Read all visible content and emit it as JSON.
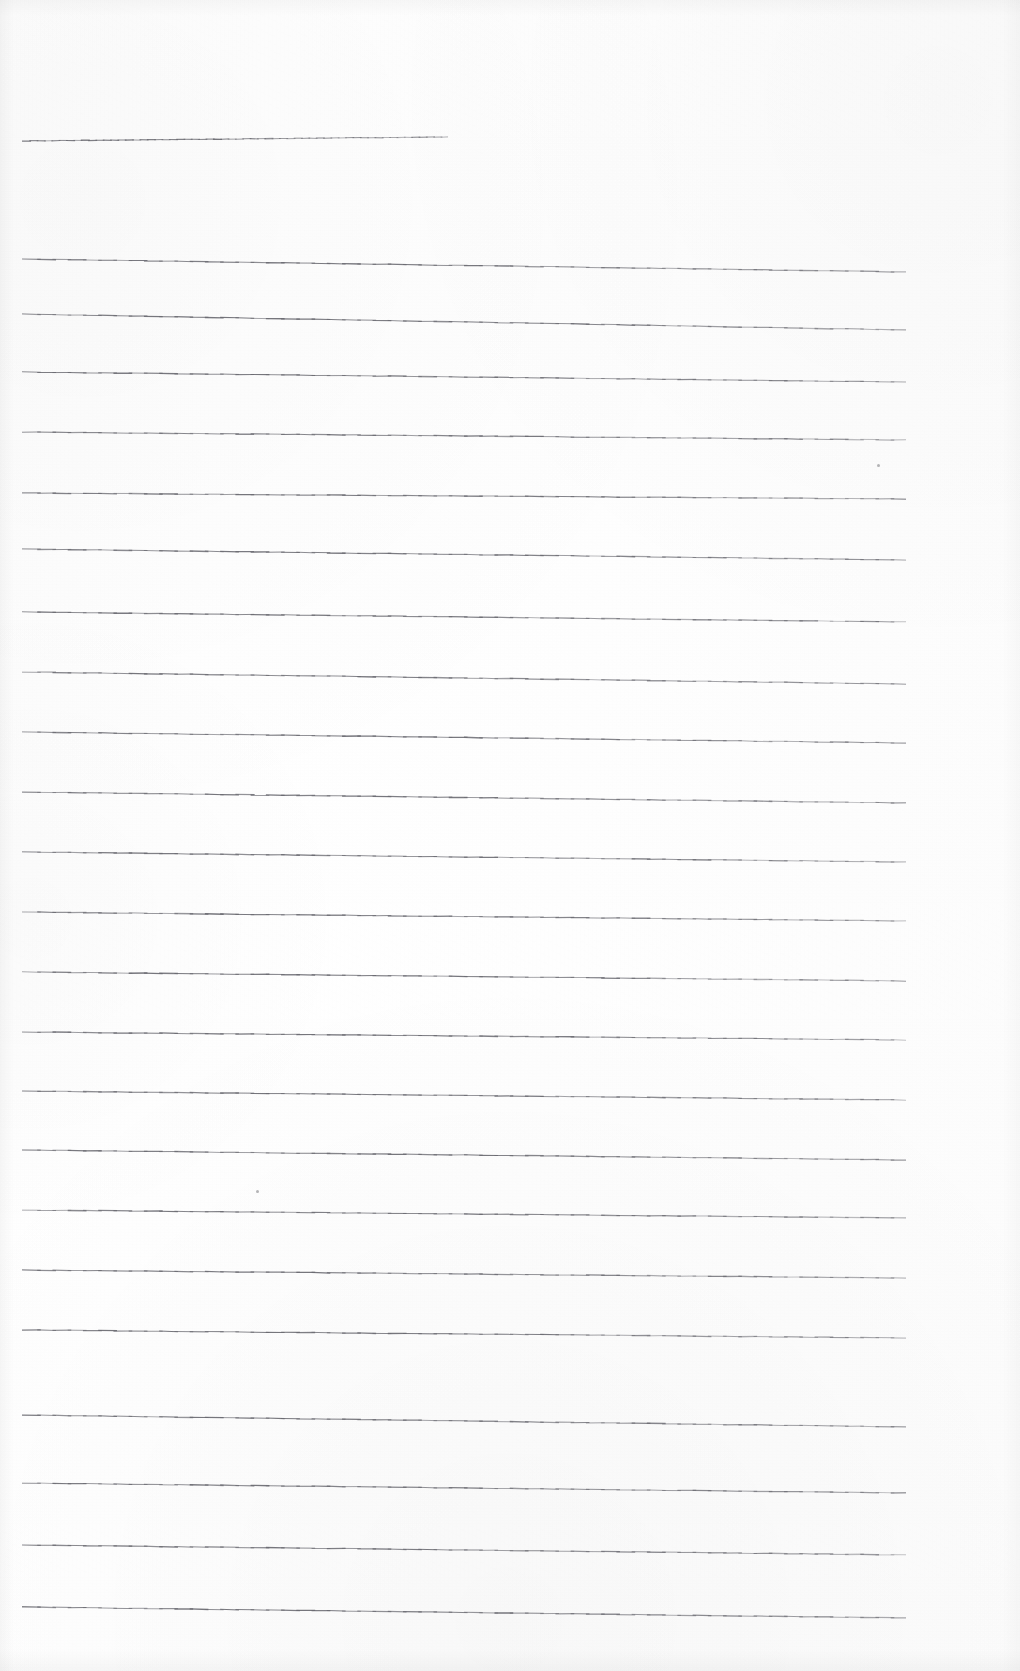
{
  "document": {
    "kind": "scanned-lined-paper",
    "title": "",
    "content_text": "",
    "page_width": 1020,
    "page_height": 1671,
    "background_color": "#fefefe",
    "rule_color": "#6b6b72",
    "rule_thickness_px": 1.1,
    "is_blank": true,
    "visible_text": []
  },
  "ruling": {
    "left_margin_x": 22,
    "right_end_x": 958,
    "title_rule_right_end_x": 448,
    "slope_drop_px": 14,
    "line_spacing_px": 64,
    "total_rules": 23,
    "rules": [
      {
        "index": 1,
        "y_left": 141,
        "y_right": 137,
        "x_start": 22,
        "x_end": 448,
        "kind": "title-rule"
      },
      {
        "index": 2,
        "y_left": 259,
        "y_right": 272,
        "x_start": 22,
        "x_end": 906,
        "kind": "body-rule"
      },
      {
        "index": 3,
        "y_left": 314,
        "y_right": 330,
        "x_start": 22,
        "x_end": 906,
        "kind": "body-rule"
      },
      {
        "index": 4,
        "y_left": 372,
        "y_right": 382,
        "x_start": 22,
        "x_end": 906,
        "kind": "body-rule"
      },
      {
        "index": 5,
        "y_left": 432,
        "y_right": 440,
        "x_start": 22,
        "x_end": 906,
        "kind": "body-rule"
      },
      {
        "index": 6,
        "y_left": 493,
        "y_right": 499,
        "x_start": 22,
        "x_end": 906,
        "kind": "body-rule"
      },
      {
        "index": 7,
        "y_left": 549,
        "y_right": 560,
        "x_start": 22,
        "x_end": 906,
        "kind": "body-rule"
      },
      {
        "index": 8,
        "y_left": 612,
        "y_right": 622,
        "x_start": 22,
        "x_end": 906,
        "kind": "body-rule"
      },
      {
        "index": 9,
        "y_left": 672,
        "y_right": 684,
        "x_start": 22,
        "x_end": 906,
        "kind": "body-rule"
      },
      {
        "index": 10,
        "y_left": 732,
        "y_right": 743,
        "x_start": 22,
        "x_end": 906,
        "kind": "body-rule"
      },
      {
        "index": 11,
        "y_left": 792,
        "y_right": 803,
        "x_start": 22,
        "x_end": 906,
        "kind": "body-rule"
      },
      {
        "index": 12,
        "y_left": 852,
        "y_right": 862,
        "x_start": 22,
        "x_end": 906,
        "kind": "body-rule"
      },
      {
        "index": 13,
        "y_left": 912,
        "y_right": 921,
        "x_start": 22,
        "x_end": 906,
        "kind": "body-rule"
      },
      {
        "index": 14,
        "y_left": 972,
        "y_right": 981,
        "x_start": 22,
        "x_end": 906,
        "kind": "body-rule"
      },
      {
        "index": 15,
        "y_left": 1032,
        "y_right": 1040,
        "x_start": 22,
        "x_end": 906,
        "kind": "body-rule"
      },
      {
        "index": 16,
        "y_left": 1091,
        "y_right": 1100,
        "x_start": 22,
        "x_end": 906,
        "kind": "body-rule"
      },
      {
        "index": 17,
        "y_left": 1150,
        "y_right": 1160,
        "x_start": 22,
        "x_end": 906,
        "kind": "body-rule"
      },
      {
        "index": 18,
        "y_left": 1210,
        "y_right": 1218,
        "x_start": 22,
        "x_end": 906,
        "kind": "body-rule"
      },
      {
        "index": 19,
        "y_left": 1270,
        "y_right": 1278,
        "x_start": 22,
        "x_end": 906,
        "kind": "body-rule"
      },
      {
        "index": 20,
        "y_left": 1330,
        "y_right": 1338,
        "x_start": 22,
        "x_end": 906,
        "kind": "body-rule"
      },
      {
        "index": 21,
        "y_left": 1415,
        "y_right": 1427,
        "x_start": 22,
        "x_end": 906,
        "kind": "body-rule"
      },
      {
        "index": 22,
        "y_left": 1483,
        "y_right": 1493,
        "x_start": 22,
        "x_end": 906,
        "kind": "body-rule"
      },
      {
        "index": 23,
        "y_left": 1545,
        "y_right": 1555,
        "x_start": 22,
        "x_end": 906,
        "kind": "body-rule"
      },
      {
        "index": 24,
        "y_left": 1607,
        "y_right": 1618,
        "x_start": 22,
        "x_end": 906,
        "kind": "body-rule"
      }
    ]
  },
  "artifacts": {
    "specks": [
      {
        "x": 877,
        "y": 464
      },
      {
        "x": 256,
        "y": 1190
      }
    ]
  }
}
